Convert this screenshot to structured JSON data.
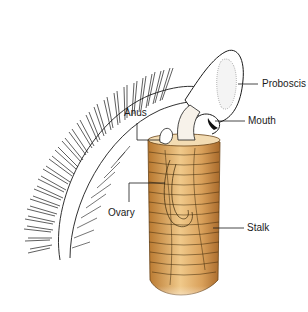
{
  "figure": {
    "colors": {
      "stalk": "#c98a3a",
      "stalk_light": "#f0c98a",
      "outline": "#1a1a1a",
      "background": "#ffffff"
    },
    "labels": [
      {
        "id": "proboscis",
        "text": "Proboscis",
        "x": 262,
        "y": 83
      },
      {
        "id": "mouth",
        "text": "Mouth",
        "x": 248,
        "y": 120
      },
      {
        "id": "anus",
        "text": "Anus",
        "x": 134,
        "y": 116
      },
      {
        "id": "ovary",
        "text": "Ovary",
        "x": 109,
        "y": 213
      },
      {
        "id": "stalk",
        "text": "Stalk",
        "x": 247,
        "y": 227
      }
    ]
  }
}
